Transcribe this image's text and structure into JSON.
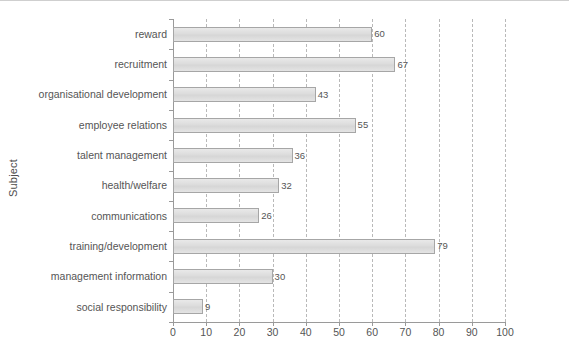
{
  "chart_data": {
    "type": "bar",
    "orientation": "horizontal",
    "title": "",
    "xlabel": "",
    "ylabel": "Subject",
    "xlim": [
      0,
      100
    ],
    "ylim": null,
    "grid": true,
    "grid_axis": "x",
    "grid_style": "dashed",
    "legend": null,
    "categories": [
      "reward",
      "recruitment",
      "organisational development",
      "employee relations",
      "talent management",
      "health/welfare",
      "communications",
      "training/development",
      "management information",
      "social responsibility"
    ],
    "values": [
      60,
      67,
      43,
      55,
      36,
      32,
      26,
      79,
      30,
      9
    ],
    "data_labels": [
      "60",
      "67",
      "43",
      "55",
      "36",
      "32",
      "26",
      "79",
      "30",
      "9"
    ],
    "xticks": [
      0,
      10,
      20,
      30,
      40,
      50,
      60,
      70,
      80,
      90,
      100
    ],
    "xtick_labels": [
      "0",
      "10",
      "20",
      "30",
      "40",
      "50",
      "60",
      "70",
      "80",
      "90",
      "100"
    ]
  },
  "style": {
    "bar_fill": "#dcdcdc",
    "bar_border": "#a6a6a6",
    "gridline_color": "#b9b9b9",
    "axis_color": "#9a9a9a",
    "text_color": "#555555",
    "background": "#ffffff"
  }
}
